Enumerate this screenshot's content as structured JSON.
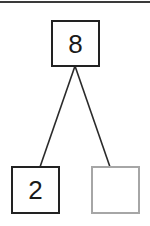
{
  "diagram": {
    "type": "number-bond",
    "whole": {
      "value": "8",
      "border_color": "#222222"
    },
    "parts": [
      {
        "value": "2",
        "border_color": "#222222",
        "filled": true
      },
      {
        "value": "",
        "border_color": "#a6a6a6",
        "filled": false
      }
    ],
    "line_color": "#2a2a2a",
    "top_rule_color": "#3a3a3a"
  }
}
